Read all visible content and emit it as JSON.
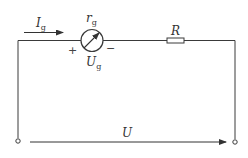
{
  "diagram": {
    "type": "circuit",
    "components": {
      "galvanometer": {
        "resistance_label": {
          "symbol": "r",
          "subscript": "g"
        },
        "voltage_label": {
          "symbol": "U",
          "subscript": "g"
        },
        "plus_sign": "+",
        "minus_sign": "−"
      },
      "resistor": {
        "label": "R"
      }
    },
    "current": {
      "symbol": "I",
      "subscript": "g"
    },
    "total_voltage": {
      "symbol": "U"
    }
  }
}
